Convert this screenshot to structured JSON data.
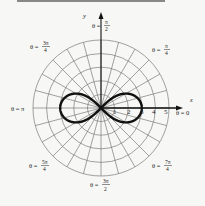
{
  "figure": {
    "axes": {
      "x_label": "x",
      "y_label": "y"
    },
    "ring_labels": [
      "1",
      "2",
      "3",
      "4",
      "5"
    ],
    "angle_labels": [
      {
        "text": "θ = π/2",
        "num": "π",
        "den": "2"
      },
      {
        "text": "θ = π/4",
        "num": "π",
        "den": "4"
      },
      {
        "text": "θ = 3π/4",
        "num": "3π",
        "den": "4"
      },
      {
        "text": "θ = π"
      },
      {
        "text": "θ = 0"
      },
      {
        "text": "θ = 5π/4",
        "num": "5π",
        "den": "4"
      },
      {
        "text": "θ = 7π/4",
        "num": "7π",
        "den": "4"
      },
      {
        "text": "θ = 3π/2",
        "num": "3π",
        "den": "2"
      }
    ],
    "colors": {
      "grid": "#7a7a7a",
      "curve": "#111111",
      "background": "#f7f7f5"
    }
  },
  "chart_data": {
    "type": "line",
    "title": "",
    "curve": "lemniscate r^2 = 9 cos(2θ)",
    "max_r": 3,
    "grid": {
      "rings": [
        1,
        2,
        3,
        4,
        5
      ],
      "radial_lines_deg_step": 15
    },
    "xlabel": "x",
    "ylabel": "y"
  }
}
